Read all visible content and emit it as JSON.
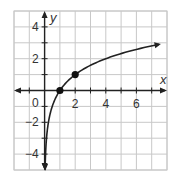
{
  "chart_data": {
    "type": "line",
    "title": "",
    "function": "y = log2(x)",
    "xlabel": "x",
    "ylabel": "y",
    "xlim": [
      -2,
      8
    ],
    "ylim": [
      -5,
      5
    ],
    "grid": true,
    "x_ticks": [
      "2",
      "4",
      "6"
    ],
    "y_ticks": [
      "4",
      "2",
      "-2",
      "-4"
    ],
    "origin_label": "0",
    "series": [
      {
        "name": "log curve",
        "x": [
          0.03125,
          0.0625,
          0.125,
          0.25,
          0.5,
          1,
          2,
          4,
          8
        ],
        "y": [
          -5,
          -4,
          -3,
          -2,
          -1,
          0,
          1,
          2,
          3
        ]
      }
    ],
    "points": [
      {
        "x": 1,
        "y": 0
      },
      {
        "x": 2,
        "y": 1
      }
    ],
    "colors": {
      "curve": "#222222",
      "grid": "#c8c8c8",
      "axis": "#222222"
    }
  }
}
